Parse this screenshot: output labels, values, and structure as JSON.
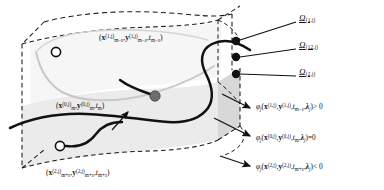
{
  "figure": {
    "type": "schematic-diagram",
    "background_color": "#ffffff",
    "slab_fill_color": "#ebebeb",
    "slab_fill_color_dark": "#d8d8d8",
    "outline_color": "#1a1a1a",
    "faint_curve_color": "#c9c9c9",
    "dot_color": "#111111",
    "gray_dot_color": "#6e6e6e"
  },
  "region_labels": [
    {
      "name": "omega-1-j",
      "symbol": "Ω",
      "subscript": "(1,j)"
    },
    {
      "name": "omega-12-j",
      "symbol": "Ω",
      "subscript": "(12,j)"
    },
    {
      "name": "omega-2-j",
      "symbol": "Ω",
      "subscript": "(2,j)"
    }
  ],
  "point_labels": [
    {
      "name": "point-label-upper",
      "open_paren": "(",
      "x_sym": "x",
      "x_sup": "(1,j)",
      "x_sub": "m−ε",
      "comma1": ",",
      "y_sym": "y",
      "y_sup": "(1,j)",
      "y_sub": "m−ε",
      "comma2": ",",
      "t_sym": "t",
      "t_sub": "m−ε",
      "close_paren": ")"
    },
    {
      "name": "point-label-middle",
      "open_paren": "(",
      "x_sym": "x",
      "x_sup": "(0,j)",
      "x_sub": "m",
      "comma1": ",",
      "y_sym": "y",
      "y_sup": "(0,j)",
      "y_sub": "m",
      "comma2": ",",
      "t_sym": "t",
      "t_sub": "m",
      "close_paren": ")"
    },
    {
      "name": "point-label-lower",
      "open_paren": "(",
      "x_sym": "x",
      "x_sup": "(2,j)",
      "x_sub": "m+ε",
      "comma1": ",",
      "y_sym": "y",
      "y_sup": "(2,j)",
      "y_sub": "m+ε",
      "comma2": ",",
      "t_sym": "t",
      "t_sub": "m+ε",
      "close_paren": ")"
    }
  ],
  "equations": [
    {
      "name": "equation-positive",
      "phi": "φ",
      "phi_sub": "j",
      "open_paren": "(",
      "x_sym": "x",
      "x_sup": "(1,j)",
      "comma1": ",",
      "y_sym": "y",
      "y_sup": "(1,j)",
      "comma2": ",",
      "t_sym": "t",
      "t_sub": "m−ε",
      "comma3": ",",
      "lambda": "λ",
      "lambda_sub": "j",
      "close_paren": ")",
      "relation": "> 0"
    },
    {
      "name": "equation-zero",
      "phi": "φ",
      "phi_sub": "j",
      "open_paren": "(",
      "x_sym": "x",
      "x_sup": "(0,j)",
      "comma1": ",",
      "y_sym": "y",
      "y_sup": "(0,j)",
      "comma2": ",",
      "t_sym": "t",
      "t_sub": "m",
      "comma3": ",",
      "lambda": "λ",
      "lambda_sub": "j",
      "close_paren": ")",
      "relation": "=0"
    },
    {
      "name": "equation-negative",
      "phi": "φ",
      "phi_sub": "j",
      "open_paren": "(",
      "x_sym": "x",
      "x_sup": "(2,j)",
      "comma1": ",",
      "y_sym": "y",
      "y_sup": "(2,j)",
      "comma2": ",",
      "t_sym": "t",
      "t_sub": "m+ε",
      "comma3": ",",
      "lambda": "λ",
      "lambda_sub": "j",
      "close_paren": ")",
      "relation": "< 0"
    }
  ],
  "markers": {
    "open_circle_upper": {
      "name": "open-circle-upper",
      "cx": 56,
      "cy": 52,
      "r": 4.6
    },
    "open_circle_lower": {
      "name": "open-circle-lower",
      "cx": 60,
      "cy": 146,
      "r": 4.6
    },
    "filled_circle_middle": {
      "name": "filled-circle-middle",
      "cx": 155,
      "cy": 96,
      "r": 5.2
    },
    "boundary_dots": [
      {
        "name": "boundary-dot-top",
        "cx": 236,
        "cy": 41,
        "r": 4.2
      },
      {
        "name": "boundary-dot-mid",
        "cx": 236,
        "cy": 57,
        "r": 4.2
      },
      {
        "name": "boundary-dot-bottom",
        "cx": 236,
        "cy": 74,
        "r": 4.2
      }
    ]
  }
}
